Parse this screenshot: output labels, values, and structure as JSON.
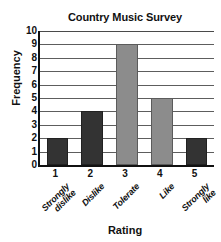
{
  "chart_data": {
    "type": "bar",
    "title": "Country Music Survey",
    "xlabel": "Rating",
    "ylabel": "Frequency",
    "categories": [
      "1",
      "2",
      "3",
      "4",
      "5"
    ],
    "category_labels": [
      "Strongly\ndislike",
      "Dislike",
      "Tolerate",
      "Like",
      "Strongly\nlike"
    ],
    "values": [
      2,
      4,
      9,
      5,
      2
    ],
    "ylim": [
      0,
      10
    ],
    "ytick_step": 1,
    "yticks": [
      "10",
      "9",
      "8",
      "7",
      "6",
      "5",
      "4",
      "3",
      "2",
      "1",
      "0"
    ],
    "grid": true,
    "legend": false,
    "bar_colors": [
      "#333333",
      "#333333",
      "#8c8c8c",
      "#8c8c8c",
      "#333333"
    ],
    "axis_color": "#111111",
    "grid_color": "#5d5d5d",
    "background": "#ffffff"
  }
}
